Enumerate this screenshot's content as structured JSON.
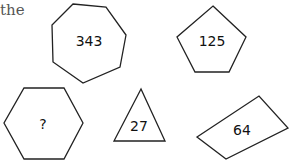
{
  "caption": "the",
  "shapes": [
    {
      "name": "heptagon",
      "sides": 7,
      "label": "343",
      "points": "73,4 106,7 126,35 120,67 83,83 53,62 52,25",
      "label_pos": [
        89,
        42
      ]
    },
    {
      "name": "pentagon",
      "sides": 5,
      "label": "125",
      "points": "213,6 246,37 229,72 195,72 177,37",
      "label_pos": [
        213,
        42
      ]
    },
    {
      "name": "hexagon",
      "sides": 6,
      "label": "?",
      "points": "24,88 64,88 83,123 64,159 24,159 4,123",
      "label_pos": [
        43,
        124
      ]
    },
    {
      "name": "triangle",
      "sides": 3,
      "label": "27",
      "points": "141,89 114,141 165,141",
      "label_pos": [
        140,
        126
      ]
    },
    {
      "name": "parallelogram",
      "sides": 4,
      "label": "64",
      "points": "197,137 259,96 288,128 226,159",
      "label_pos": [
        242,
        130
      ]
    }
  ]
}
